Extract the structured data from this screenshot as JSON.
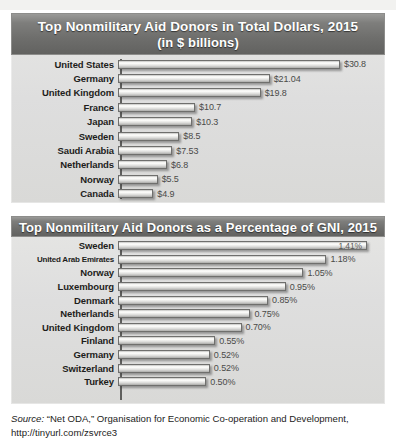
{
  "chart_data": [
    {
      "type": "bar",
      "orientation": "horizontal",
      "title": "Top Nonmilitary Aid Donors in Total Dollars, 2015",
      "subtitle": "(in $ billions)",
      "xlabel": "",
      "ylabel": "",
      "unit": "$ billions",
      "xlim": [
        0,
        30.8
      ],
      "grid": false,
      "legend": "none",
      "categories": [
        "United States",
        "Germany",
        "United Kingdom",
        "France",
        "Japan",
        "Sweden",
        "Saudi Arabia",
        "Netherlands",
        "Norway",
        "Canada"
      ],
      "values": [
        30.8,
        21.04,
        19.8,
        10.7,
        10.3,
        8.5,
        7.53,
        6.8,
        5.5,
        4.9
      ],
      "value_labels": [
        "$30.8",
        "$21.04",
        "$19.8",
        "$10.7",
        "$10.3",
        "$8.5",
        "$7.53",
        "$6.8",
        "$5.5",
        "$4.9"
      ]
    },
    {
      "type": "bar",
      "orientation": "horizontal",
      "title": "Top Nonmilitary Aid Donors as a Percentage of GNI, 2015",
      "subtitle": "",
      "xlabel": "",
      "ylabel": "",
      "unit": "percent of GNI",
      "xlim": [
        0,
        1.41
      ],
      "grid": false,
      "legend": "none",
      "categories": [
        "Sweden",
        "United Arab Emirates",
        "Norway",
        "Luxembourg",
        "Denmark",
        "Netherlands",
        "United Kingdom",
        "Finland",
        "Germany",
        "Switzerland",
        "Turkey"
      ],
      "values": [
        1.41,
        1.18,
        1.05,
        0.95,
        0.85,
        0.75,
        0.7,
        0.55,
        0.52,
        0.52,
        0.5
      ],
      "value_labels": [
        "1.41%",
        "1.18%",
        "1.05%",
        "0.95%",
        "0.85%",
        "0.75%",
        "0.70%",
        "0.55%",
        "0.52%",
        "0.52%",
        "0.50%"
      ]
    }
  ],
  "chart1": {
    "title": "Top Nonmilitary Aid Donors in Total Dollars, 2015",
    "subtitle": "(in $ billions)"
  },
  "chart2": {
    "title": "Top Nonmilitary Aid Donors as a Percentage of GNI, 2015"
  },
  "source": {
    "label": "Source:",
    "text": " “Net ODA,” Organisation for Economic Co-operation and Development, http://tinyurl.com/zsvrce3"
  },
  "colors": {
    "banner_dark": "#6e6e6c",
    "panel_bg": "#dedede",
    "bar_light": "#fbfbf9",
    "bar_border": "#6f6f6d",
    "text_dark": "#1d1d1b",
    "value_text": "#4a4a48"
  }
}
